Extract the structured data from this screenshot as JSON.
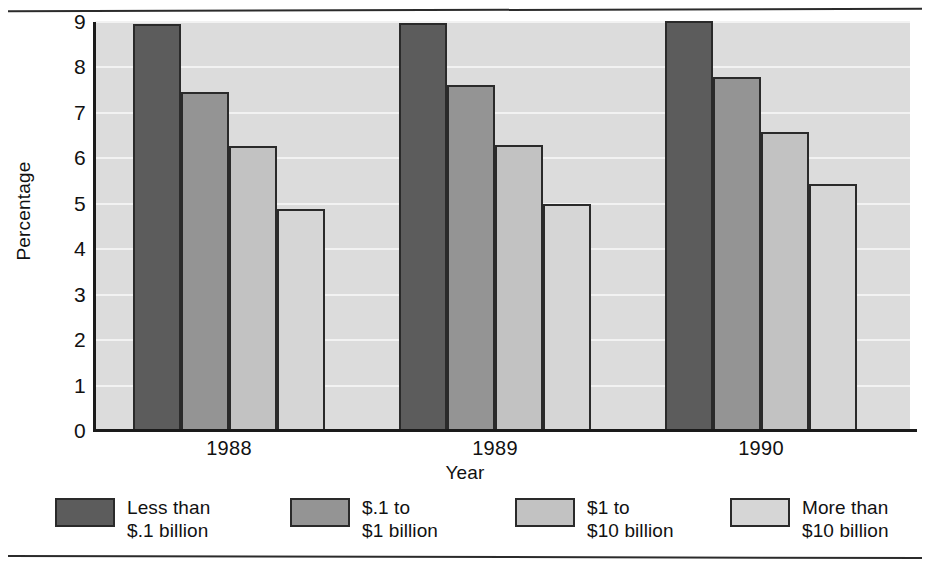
{
  "chart_data": {
    "type": "bar",
    "title": "",
    "xlabel": "Year",
    "ylabel": "Percentage",
    "categories": [
      "1988",
      "1989",
      "1990"
    ],
    "series": [
      {
        "name": "Less than\n$.1 billion",
        "color": "#5c5c5c",
        "values": [
          8.95,
          8.98,
          9.02
        ]
      },
      {
        "name": "$.1 to\n$1 billion",
        "color": "#949494",
        "values": [
          7.45,
          7.62,
          7.78
        ]
      },
      {
        "name": "$1 to\n$10 billion",
        "color": "#c2c2c2",
        "values": [
          6.27,
          6.29,
          6.58
        ]
      },
      {
        "name": "More than\n$10 billion",
        "color": "#d6d6d6",
        "values": [
          4.89,
          5.0,
          5.44
        ]
      }
    ],
    "ylim": [
      0,
      9
    ],
    "y_ticks": [
      "0",
      "1",
      "2",
      "3",
      "4",
      "5",
      "6",
      "7",
      "8",
      "9"
    ],
    "grid": true,
    "gridline_color": "#f2f2f2",
    "plot_background": "#dcdcdc",
    "legend_position": "bottom"
  },
  "legend": {
    "items": [
      {
        "label": "Less than\n$.1 billion",
        "color": "#5c5c5c"
      },
      {
        "label": "$.1 to\n$1 billion",
        "color": "#949494"
      },
      {
        "label": "$1 to\n$10 billion",
        "color": "#c2c2c2"
      },
      {
        "label": "More than\n$10 billion",
        "color": "#d6d6d6"
      }
    ]
  }
}
